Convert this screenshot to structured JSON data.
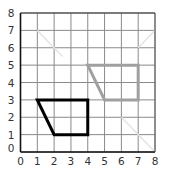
{
  "diagram": {
    "type": "coordinate-grid",
    "x_range": [
      0,
      8
    ],
    "y_range": [
      0,
      8
    ],
    "x_ticks": [
      "0",
      "1",
      "2",
      "3",
      "4",
      "5",
      "6",
      "7",
      "8"
    ],
    "y_ticks": [
      "0",
      "1",
      "2",
      "3",
      "4",
      "5",
      "6",
      "7",
      "8"
    ],
    "shapes": [
      {
        "name": "original-trapezoid",
        "color": "#000000",
        "points": [
          [
            1,
            3
          ],
          [
            4,
            3
          ],
          [
            4,
            1
          ],
          [
            2,
            1
          ]
        ]
      },
      {
        "name": "translated-trapezoid",
        "color": "#a0a0a0",
        "points": [
          [
            4,
            5
          ],
          [
            7,
            5
          ],
          [
            7,
            3
          ],
          [
            5,
            3
          ]
        ]
      }
    ],
    "faint_lines": [
      {
        "points": [
          [
            1,
            7
          ],
          [
            2.5,
            5.5
          ]
        ]
      },
      {
        "points": [
          [
            8,
            7
          ],
          [
            7,
            6
          ]
        ]
      },
      {
        "points": [
          [
            6,
            2
          ],
          [
            8,
            0
          ]
        ]
      }
    ]
  }
}
